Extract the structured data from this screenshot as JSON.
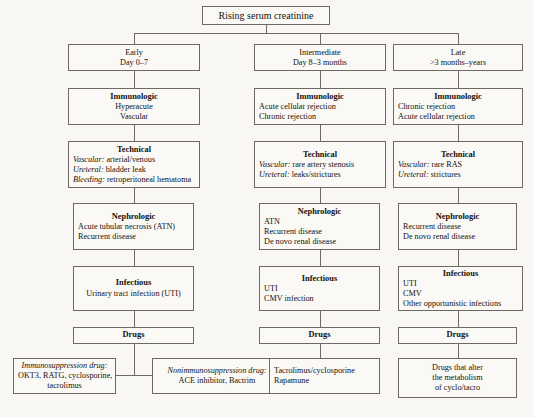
{
  "title": "Rising serum creatinine",
  "columns": [
    {
      "id": "early",
      "header": {
        "title": "Early",
        "subtitle": "Day 0–7"
      },
      "immunologic": {
        "header": "Immunologic",
        "items": [
          "Hyperacute",
          "Vascular"
        ]
      },
      "technical": {
        "header": "Technical",
        "items": [
          {
            "label": "Vascular:",
            "text": "arterial/venous"
          },
          {
            "label": "Ureteral:",
            "text": "bladder leak"
          },
          {
            "label": "Bleeding:",
            "text": "retroperitoneal hematoma"
          }
        ]
      },
      "nephrologic": {
        "header": "Nephrologic",
        "items": [
          "Acute tubular necrosis (ATN)",
          "Recurrent disease"
        ]
      },
      "infectious": {
        "header": "Infectious",
        "items": [
          "Urinary tract infection (UTI)"
        ]
      },
      "drugs": {
        "header": "Drugs"
      },
      "drug_detail_left": {
        "label": "Immunosuppression drug:",
        "items": [
          "OKT3, RATG, cyclosporine,",
          "tacrolimus"
        ]
      },
      "drug_detail_right": {
        "label": "Nonimmunosuppression drug:",
        "items": [
          "ACE inhibitor, Bactrim"
        ]
      }
    },
    {
      "id": "intermediate",
      "header": {
        "title": "Intermediate",
        "subtitle": "Day 8–3 months"
      },
      "immunologic": {
        "header": "Immunologic",
        "items": [
          "Acute cellular rejection",
          "Chronic rejection"
        ]
      },
      "technical": {
        "header": "Technical",
        "items": [
          {
            "label": "Vascular:",
            "text": "rare artery stenosis"
          },
          {
            "label": "Ureteral:",
            "text": "leaks/strictures"
          }
        ]
      },
      "nephrologic": {
        "header": "Nephrologic",
        "items": [
          "ATN",
          "Recurrent disease",
          "De novo renal disease"
        ]
      },
      "infectious": {
        "header": "Infectious",
        "items": [
          "UTI",
          "CMV infection"
        ]
      },
      "drugs": {
        "header": "Drugs"
      },
      "drug_detail": {
        "items": [
          "Tacrolimus/cyclosporine",
          "Rapamune"
        ]
      }
    },
    {
      "id": "late",
      "header": {
        "title": "Late",
        "subtitle": ">3 months–years"
      },
      "immunologic": {
        "header": "Immunologic",
        "items": [
          "Chronic rejection",
          "Acute cellular rejection"
        ]
      },
      "technical": {
        "header": "Technical",
        "items": [
          {
            "label": "Vascular:",
            "text": "rare RAS"
          },
          {
            "label": "Ureteral:",
            "text": "strictures"
          }
        ]
      },
      "nephrologic": {
        "header": "Nephrologic",
        "items": [
          "Recurrent disease",
          "De novo renal disease"
        ]
      },
      "infectious": {
        "header": "Infectious",
        "items": [
          "UTI",
          "CMV",
          "Other opportunistic infections"
        ]
      },
      "drugs": {
        "header": "Drugs"
      },
      "drug_detail": {
        "items": [
          "Drugs that alter",
          "the metabolism",
          "of cyclo/tacro"
        ]
      }
    }
  ]
}
